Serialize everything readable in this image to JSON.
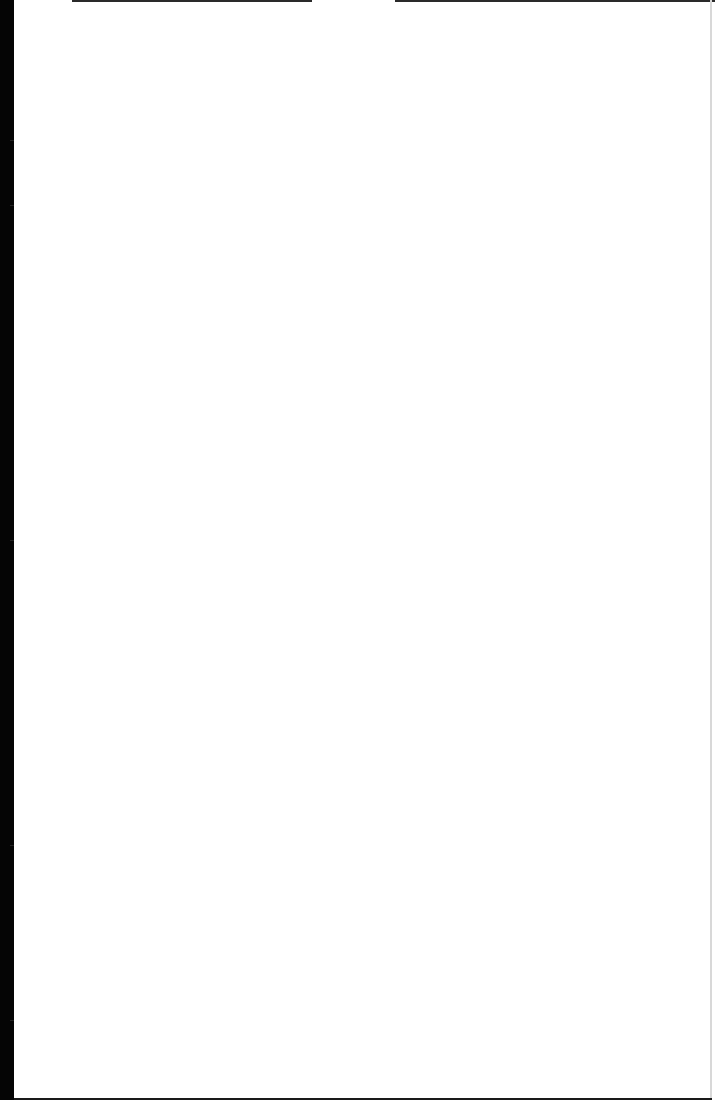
{
  "document": {
    "type": "blank scanned page",
    "text": "",
    "colors": {
      "paper": "#ffffff",
      "scan_border": "#050505"
    }
  }
}
